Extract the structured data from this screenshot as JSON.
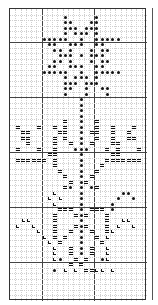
{
  "pattern": {
    "title": "Cross-stitch flower chart",
    "columns": 26,
    "rows": 53,
    "major_every": 10,
    "major_col_offset": 6,
    "major_row_offset": 6,
    "legend": {
      "*": "filled-dot-symbol",
      "=": "double-dash-symbol",
      "L": "l-shape-symbol",
      ".": "empty"
    },
    "colors": {
      "grid_major": "#444444",
      "grid_minor": "#cfcfcf",
      "symbol": "#111111",
      "background": "#ffffff"
    },
    "grid": [
      "..........................",
      "..........*.....*.........",
      "..........**...**.........",
      "..........***.***.........",
      "..........*.***.*.........",
      "......*****..*..*****.....",
      ".......**..***..**........",
      "........**.*...*.**.......",
      ".........***.*.***........",
      "........**.*...*.**.......",
      ".......**..***..**........",
      "......*****..*..*****.....",
      "..........*.***.*.........",
      "..........***.***.........",
      "..........**..*..**.......",
      "..........*...*...*.......",
      ".............*............",
      ".............*............",
      ".............*............",
      ".............*............",
      "..........=..*..=.........",
      ".=...=..=.=..*..=..=...=..",
      "..==.....==..*.==..=..=...",
      "..==....=.=..*..=..=..==..",
      "...=....=..=.*.=...==.....",
      ".=...=..=...***...=.=...=.",
      ".......==....*.....==.....",
      ".======.=....*....=======.",
      "........=....*...=........",
      ".........=...*..=.........",
      "..........=..*.=..........",
      "...........=.*=...........",
      "..........=*.*.*=.........",
      "........L....*.......**...",
      ".......L.L...*......*..*..",
      "........L....*.....*......",
      ".........===.*.===.*......",
      "........=...=*=...=.......",
      "..LL....=....*....=..LL...",
      ".L..L...=...=*=...=.L..L..",
      ".....L..=..=.*.=..=L......",
      "......L.=.=..*..=.L.......",
      ".......L.=...*...=........",
      "........L..=.*.=..L.......",
      "........L..=.*.=..L.......",
      "........L*..=.=..*L.......",
      "...........=.=............",
      "........*.L.L.==LL.L......",
      "..........................",
      "..........................",
      "..........................",
      "..........................",
      ".........................."
    ]
  }
}
